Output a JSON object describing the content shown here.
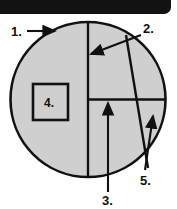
{
  "figure": {
    "background_color": "#ffffff",
    "top_bar": {
      "name": "top-black-bar",
      "color": "#121212",
      "x": 0,
      "y": 0,
      "width": 171,
      "height": 14,
      "corner_radius": 7
    },
    "circle": {
      "name": "main-circle",
      "center_x": 88,
      "center_y": 99.5,
      "radius": 77.5,
      "fill_color": "#cfcfcf",
      "stroke_color": "#111111",
      "stroke_width": 2.6
    },
    "lines": [
      {
        "name": "vertical-diameter",
        "x1": 88,
        "y1": 22,
        "x2": 88,
        "y2": 177,
        "stroke_color": "#111111",
        "stroke_width": 2.4
      },
      {
        "name": "horizontal-radius",
        "x1": 88,
        "y1": 99.5,
        "x2": 165.5,
        "y2": 99.5,
        "stroke_color": "#111111",
        "stroke_width": 2.4
      },
      {
        "name": "chord-line",
        "x1": 126,
        "y1": 35,
        "x2": 148,
        "y2": 168,
        "stroke_color": "#111111",
        "stroke_width": 2.4
      }
    ],
    "box": {
      "name": "callout-square",
      "x": 33,
      "y": 84,
      "width": 35,
      "height": 36,
      "fill_color": "#cfcfcf",
      "stroke_color": "#111111",
      "stroke_width": 2.6,
      "label": "4."
    },
    "labels": [
      {
        "id": "1",
        "name": "label-1",
        "text": "1.",
        "text_x": 11,
        "text_y": 36,
        "arrow": {
          "name": "leader-arrow-1",
          "x1": 27,
          "y1": 31,
          "x2": 55,
          "y2": 31,
          "points_to": "circle-outline"
        }
      },
      {
        "id": "2",
        "name": "label-2",
        "text": "2.",
        "text_x": 143,
        "text_y": 33,
        "arrow": {
          "name": "leader-arrow-2",
          "x1": 141,
          "y1": 35,
          "x2": 91,
          "y2": 54,
          "points_to": "vertical-diameter"
        }
      },
      {
        "id": "3",
        "name": "label-3",
        "text": "3.",
        "text_x": 102,
        "text_y": 205,
        "arrow": {
          "name": "leader-arrow-3",
          "x1": 108,
          "y1": 192,
          "x2": 108,
          "y2": 103,
          "points_to": "horizontal-radius"
        }
      },
      {
        "id": "4",
        "name": "label-4",
        "text": "4.",
        "text_x": 44,
        "text_y": 107,
        "arrow": null
      },
      {
        "id": "5",
        "name": "label-5",
        "text": "5.",
        "text_x": 140,
        "text_y": 185,
        "arrow": {
          "name": "leader-arrow-5",
          "x1": 145,
          "y1": 170,
          "x2": 153,
          "y2": 116,
          "points_to": "chord-arc-intersection"
        }
      }
    ],
    "legend_note": "Numbered leader labels 1 through 5 identify parts of the shaded circle figure."
  }
}
